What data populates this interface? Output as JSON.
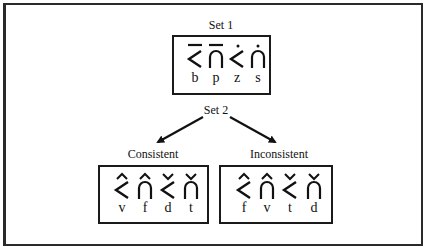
{
  "figure": {
    "set1": {
      "title": "Set 1",
      "items": [
        {
          "shape": "angle",
          "mark": "macron",
          "letter": "b"
        },
        {
          "shape": "arch",
          "mark": "macron",
          "letter": "p"
        },
        {
          "shape": "angle",
          "mark": "dot",
          "letter": "z"
        },
        {
          "shape": "arch",
          "mark": "dot",
          "letter": "s"
        }
      ]
    },
    "set2": {
      "title": "Set 2",
      "branches": [
        {
          "title": "Consistent",
          "items": [
            {
              "shape": "angle",
              "mark": "circumflex",
              "letter": "v"
            },
            {
              "shape": "arch",
              "mark": "circumflex",
              "letter": "f"
            },
            {
              "shape": "angle",
              "mark": "caron",
              "letter": "d"
            },
            {
              "shape": "arch",
              "mark": "caron",
              "letter": "t"
            }
          ]
        },
        {
          "title": "Inconsistent",
          "items": [
            {
              "shape": "angle",
              "mark": "circumflex",
              "letter": "f"
            },
            {
              "shape": "arch",
              "mark": "circumflex",
              "letter": "v"
            },
            {
              "shape": "angle",
              "mark": "caron",
              "letter": "t"
            },
            {
              "shape": "arch",
              "mark": "caron",
              "letter": "d"
            }
          ]
        }
      ]
    },
    "colors": {
      "ink": "#111111",
      "background": "#ffffff"
    }
  }
}
